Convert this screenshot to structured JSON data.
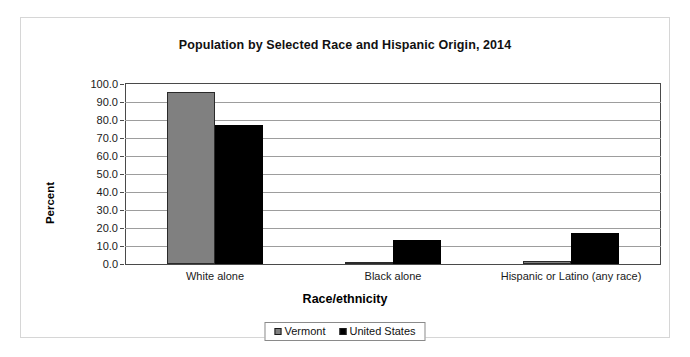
{
  "chart_data": {
    "type": "bar",
    "title": "Population by Selected Race and Hispanic Origin, 2014",
    "xlabel": "Race/ethnicity",
    "ylabel": "Percent",
    "categories": [
      "White alone",
      "Black alone",
      "Hispanic or Latino (any race)"
    ],
    "series": [
      {
        "name": "Vermont",
        "color": "#808080",
        "values": [
          95.3,
          1.2,
          1.8
        ]
      },
      {
        "name": "United States",
        "color": "#000000",
        "values": [
          77.4,
          13.2,
          17.4
        ]
      }
    ],
    "ylim": [
      0.0,
      100.0
    ],
    "ytick_step": 10.0,
    "ytick_labels": [
      "100.0",
      "90.0",
      "80.0",
      "70.0",
      "60.0",
      "50.0",
      "40.0",
      "30.0",
      "20.0",
      "10.0",
      "0.0"
    ],
    "grid": true,
    "legend_position": "bottom"
  },
  "style": {
    "vermont_color": "#808080",
    "united_states_color": "#000000",
    "gridline_color": "#9d9d9d",
    "axis_color": "#4a4a4a",
    "frame_color": "#d6d6d6"
  }
}
